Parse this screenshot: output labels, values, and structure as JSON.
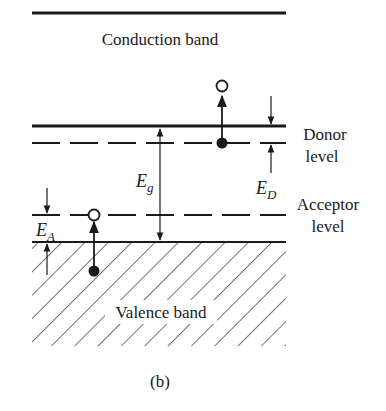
{
  "diagram": {
    "conduction_band_label": "Conduction band",
    "valence_band_label": "Valence band",
    "donor_label_line1": "Donor",
    "donor_label_line2": "level",
    "acceptor_label_line1": "Acceptor",
    "acceptor_label_line2": "level",
    "energy_gap_symbol": "E",
    "energy_gap_subscript": "g",
    "donor_energy_symbol": "E",
    "donor_energy_subscript": "D",
    "acceptor_energy_symbol": "E",
    "acceptor_energy_subscript": "A",
    "caption": "(b)"
  },
  "colors": {
    "ink": "#1a1a1a",
    "background": "#ffffff"
  }
}
